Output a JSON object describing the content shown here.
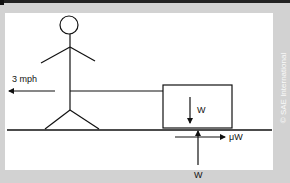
{
  "diagram": {
    "speed_label": "3 mph",
    "box_weight_label": "W",
    "normal_force_label": "W",
    "friction_label": "μW",
    "credit": "© SAE International"
  },
  "colors": {
    "background": "#d2d2d2",
    "panel": "#ffffff",
    "stroke": "#111111"
  }
}
